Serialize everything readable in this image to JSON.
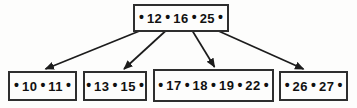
{
  "diagram": {
    "type": "b-tree",
    "colors": {
      "background": "#fdfdfc",
      "line": "#1c1c1c",
      "border": "#2e2e2e",
      "text": "#111111"
    },
    "bullet": "•",
    "root": {
      "name": "root",
      "keys": [
        "12",
        "16",
        "25"
      ]
    },
    "leaves": [
      {
        "name": "leaf-1",
        "keys": [
          "10",
          "11"
        ]
      },
      {
        "name": "leaf-2",
        "keys": [
          "13",
          "15"
        ]
      },
      {
        "name": "leaf-3",
        "keys": [
          "17",
          "18",
          "19",
          "22"
        ]
      },
      {
        "name": "leaf-4",
        "keys": [
          "26",
          "27"
        ]
      }
    ],
    "arrows": [
      {
        "from_pointer_slot": 0,
        "to_leaf": 0,
        "tip_dx": 3
      },
      {
        "from_pointer_slot": 1,
        "to_leaf": 1,
        "tip_dx": 9
      },
      {
        "from_pointer_slot": 2,
        "to_leaf": 2,
        "tip_dx": 1
      },
      {
        "from_pointer_slot": 3,
        "to_leaf": 3,
        "tip_dx": -10
      }
    ]
  }
}
